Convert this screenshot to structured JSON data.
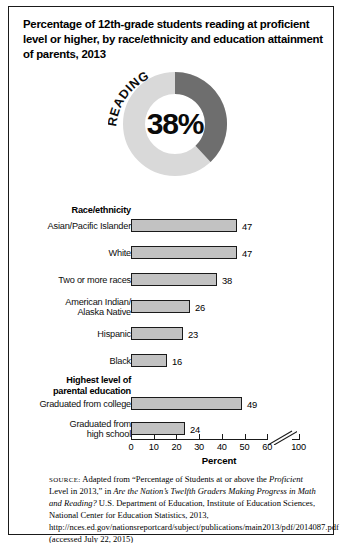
{
  "title": "Percentage of 12th-grade students reading at proficient level or higher, by race/ethnicity and education attainment of parents, 2013",
  "donut": {
    "label": "READING",
    "value_text": "38%",
    "value": 38,
    "arc_color": "#6e6e6e",
    "track_color": "#d9d9d9"
  },
  "chart_data": {
    "type": "bar",
    "orientation": "horizontal",
    "title": "Percentage of 12th-grade students reading at proficient level or higher, by race/ethnicity and education attainment of parents, 2013",
    "xlabel": "Percent",
    "ylabel": "",
    "xlim": [
      0,
      100
    ],
    "xticks": [
      0,
      10,
      20,
      30,
      40,
      50,
      60,
      100
    ],
    "xtick_labels": [
      "0",
      "10",
      "20",
      "30",
      "40",
      "50",
      "60",
      "100"
    ],
    "axis_break": {
      "after": 60,
      "before": 100,
      "style": "double-slash"
    },
    "grid": false,
    "legend": false,
    "bar_color": "#c2c2c2",
    "bar_edge_color": "#1a1a1a",
    "groups": [
      {
        "name": "Race/ethnicity",
        "categories": [
          "Asian/Pacific Islander",
          "White",
          "Two or more races",
          "American Indian/\nAlaska Native",
          "Hispanic",
          "Black"
        ],
        "values": [
          47,
          47,
          38,
          26,
          23,
          16
        ]
      },
      {
        "name": "Highest level of\nparental education",
        "categories": [
          "Graduated from college",
          "Graduated from\nhigh school"
        ],
        "values": [
          49,
          24
        ]
      }
    ],
    "categories": [
      "Asian/Pacific Islander",
      "White",
      "Two or more races",
      "American Indian/Alaska Native",
      "Hispanic",
      "Black",
      "Graduated from college",
      "Graduated from high school"
    ],
    "values": [
      47,
      47,
      38,
      26,
      23,
      16,
      49,
      24
    ]
  },
  "groups": {
    "race": {
      "heading": "Race/ethnicity",
      "rows": [
        {
          "label_line1": "Asian/Pacific Islander",
          "label_line2": "",
          "value": 47
        },
        {
          "label_line1": "White",
          "label_line2": "",
          "value": 47
        },
        {
          "label_line1": "Two or more races",
          "label_line2": "",
          "value": 38
        },
        {
          "label_line1": "American Indian/",
          "label_line2": "Alaska Native",
          "value": 26
        },
        {
          "label_line1": "Hispanic",
          "label_line2": "",
          "value": 23
        },
        {
          "label_line1": "Black",
          "label_line2": "",
          "value": 16
        }
      ]
    },
    "parental": {
      "heading_line1": "Highest level of",
      "heading_line2": "parental education",
      "rows": [
        {
          "label_line1": "Graduated from college",
          "label_line2": "",
          "value": 49
        },
        {
          "label_line1": "Graduated from",
          "label_line2": "high school",
          "value": 24
        }
      ]
    }
  },
  "axis": {
    "label": "Percent",
    "ticks": [
      "0",
      "10",
      "20",
      "30",
      "40",
      "50",
      "60",
      "100"
    ]
  },
  "source": {
    "prefix": "SOURCE:",
    "text_1": " Adapted from “Percentage of Students at or above the ",
    "italic_1": "Proficient",
    "text_2": " Level in 2013,” in ",
    "italic_2": "Are the Nation’s Twelfth Graders Making Progress in Math and Reading?",
    "text_3": " U.S. Department of Education, Institute of Education Sciences, National Center for Education Statistics, 2013, http://nces.ed.gov/nationsreportcard/subject/publications/main2013/pdf/2014087.pdf (accessed July 22, 2015)"
  }
}
